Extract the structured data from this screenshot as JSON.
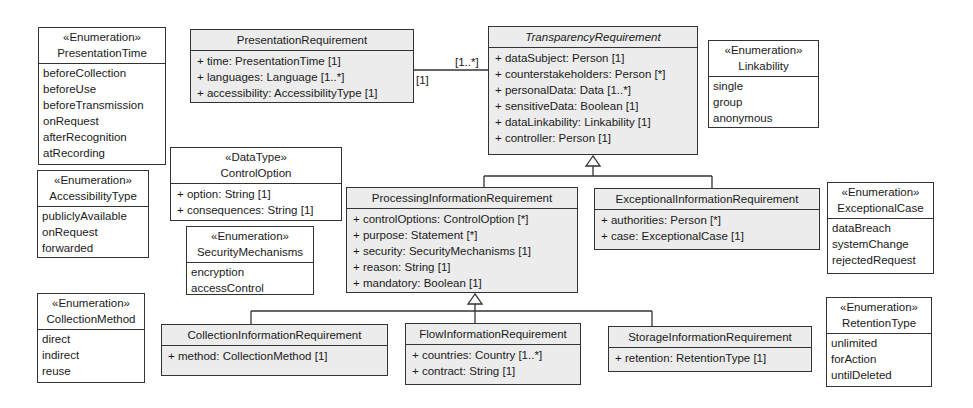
{
  "diagram": {
    "type": "uml-class-diagram",
    "classes": {
      "presentation_requirement": {
        "name": "PresentationRequirement",
        "attributes": [
          "+ time: PresentationTime [1]",
          "+ languages: Language [1..*]",
          "+ accessibility: AccessibilityType [1]"
        ]
      },
      "transparency_requirement": {
        "name": "TransparencyRequirement",
        "abstract": true,
        "attributes": [
          "+ dataSubject: Person [1]",
          "+ counterstakeholders: Person [*]",
          "+ personalData: Data [1..*]",
          "+ sensitiveData: Boolean [1]",
          "+ dataLinkability: Linkability [1]",
          "+ controller: Person [1]"
        ]
      },
      "processing_information_requirement": {
        "name": "ProcessingInformationRequirement",
        "attributes": [
          "+ controlOptions: ControlOption [*]",
          "+ purpose: Statement [*]",
          "+ security: SecurityMechanisms [1]",
          "+ reason: String [1]",
          "+ mandatory: Boolean [1]"
        ]
      },
      "exceptional_information_requirement": {
        "name": "ExceptionalInformationRequirement",
        "attributes": [
          "+ authorities: Person [*]",
          "+ case: ExceptionalCase [1]"
        ]
      },
      "collection_information_requirement": {
        "name": "CollectionInformationRequirement",
        "attributes": [
          "+ method: CollectionMethod [1]"
        ]
      },
      "flow_information_requirement": {
        "name": "FlowInformationRequirement",
        "attributes": [
          "+ countries: Country [1..*]",
          "+ contract: String [1]"
        ]
      },
      "storage_information_requirement": {
        "name": "StorageInformationRequirement",
        "attributes": [
          "+ retention: RetentionType [1]"
        ]
      }
    },
    "datatypes": {
      "control_option": {
        "stereotype": "«DataType»",
        "name": "ControlOption",
        "attributes": [
          "+ option: String [1]",
          "+ consequences: String [1]"
        ]
      }
    },
    "enumerations": {
      "presentation_time": {
        "stereotype": "«Enumeration»",
        "name": "PresentationTime",
        "literals": [
          "beforeCollection",
          "beforeUse",
          "beforeTransmission",
          "onRequest",
          "afterRecognition",
          "atRecording"
        ]
      },
      "accessibility_type": {
        "stereotype": "«Enumeration»",
        "name": "AccessibilityType",
        "literals": [
          "publiclyAvailable",
          "onRequest",
          "forwarded"
        ]
      },
      "security_mechanisms": {
        "stereotype": "«Enumeration»",
        "name": "SecurityMechanisms",
        "literals": [
          "encryption",
          "accessControl"
        ]
      },
      "collection_method": {
        "stereotype": "«Enumeration»",
        "name": "CollectionMethod",
        "literals": [
          "direct",
          "indirect",
          "reuse"
        ]
      },
      "linkability": {
        "stereotype": "«Enumeration»",
        "name": "Linkability",
        "literals": [
          "single",
          "group",
          "anonymous"
        ]
      },
      "exceptional_case": {
        "stereotype": "«Enumeration»",
        "name": "ExceptionalCase",
        "literals": [
          "dataBreach",
          "systemChange",
          "rejectedRequest"
        ]
      },
      "retention_type": {
        "stereotype": "«Enumeration»",
        "name": "RetentionType",
        "literals": [
          "unlimited",
          "forAction",
          "untilDeleted"
        ]
      }
    },
    "associations": [
      {
        "from": "PresentationRequirement",
        "to": "TransparencyRequirement",
        "from_multiplicity": "[1]",
        "to_multiplicity": "[1..*]"
      }
    ],
    "generalizations": [
      {
        "child": "ProcessingInformationRequirement",
        "parent": "TransparencyRequirement"
      },
      {
        "child": "ExceptionalInformationRequirement",
        "parent": "TransparencyRequirement"
      },
      {
        "child": "CollectionInformationRequirement",
        "parent": "ProcessingInformationRequirement"
      },
      {
        "child": "FlowInformationRequirement",
        "parent": "ProcessingInformationRequirement"
      },
      {
        "child": "StorageInformationRequirement",
        "parent": "ProcessingInformationRequirement"
      }
    ],
    "colors": {
      "class_fill": "#ececec",
      "enum_fill": "#ffffff",
      "line": "#333333"
    }
  }
}
